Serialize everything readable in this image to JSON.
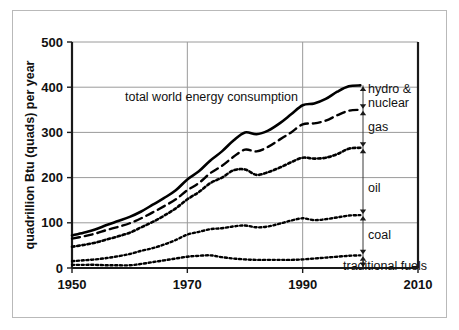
{
  "chart_data": {
    "type": "line",
    "title": "",
    "xlabel": "",
    "ylabel": "quadrillion Btu (quads) per year",
    "xlim": [
      1950,
      2010
    ],
    "ylim": [
      0,
      500
    ],
    "xticks": [
      1950,
      1970,
      1990,
      2010
    ],
    "yticks": [
      0,
      100,
      200,
      300,
      400,
      500
    ],
    "grid": true,
    "legend_position": "right-inline-labels",
    "annotations": [
      {
        "text": "total world energy consumption",
        "x": 1966,
        "y": 368
      }
    ],
    "x": [
      1950,
      1952,
      1954,
      1956,
      1958,
      1960,
      1962,
      1964,
      1966,
      1968,
      1970,
      1972,
      1974,
      1976,
      1978,
      1980,
      1982,
      1984,
      1986,
      1988,
      1990,
      1992,
      1994,
      1996,
      1998,
      2000
    ],
    "series": [
      {
        "name": "total world energy consumption",
        "label": "total world energy consumption",
        "style": "solid",
        "values": [
          72,
          78,
          85,
          95,
          104,
          113,
          125,
          140,
          155,
          172,
          196,
          214,
          238,
          258,
          282,
          300,
          296,
          304,
          320,
          340,
          360,
          364,
          374,
          390,
          402,
          404
        ]
      },
      {
        "name": "hydro-and-nuclear-boundary",
        "label": "hydro & nuclear",
        "style": "dashed",
        "values": [
          65,
          70,
          76,
          84,
          91,
          99,
          110,
          123,
          137,
          152,
          172,
          188,
          210,
          226,
          246,
          262,
          258,
          268,
          284,
          300,
          318,
          320,
          326,
          338,
          348,
          350
        ]
      },
      {
        "name": "gas-boundary",
        "label": "gas",
        "style": "dotted-coarse",
        "values": [
          47,
          51,
          56,
          63,
          70,
          78,
          90,
          102,
          116,
          132,
          152,
          168,
          188,
          200,
          216,
          218,
          206,
          212,
          222,
          234,
          244,
          242,
          244,
          252,
          264,
          266
        ]
      },
      {
        "name": "oil-boundary",
        "label": "oil",
        "style": "dotted-fine",
        "values": [
          15,
          17,
          19,
          22,
          26,
          31,
          38,
          44,
          52,
          62,
          74,
          80,
          86,
          88,
          92,
          94,
          90,
          92,
          98,
          105,
          110,
          106,
          108,
          112,
          116,
          117
        ]
      },
      {
        "name": "coal-boundary",
        "label": "coal",
        "style": "dotted-fine",
        "values": [
          7,
          7,
          7,
          6,
          6,
          6,
          9,
          13,
          17,
          21,
          25,
          27,
          28,
          24,
          21,
          19,
          18,
          18,
          18,
          18,
          19,
          21,
          23,
          25,
          27,
          28
        ]
      }
    ],
    "stack_labels": [
      "hydro & nuclear",
      "gas",
      "oil",
      "coal",
      "traditional fuels"
    ],
    "brackets": [
      {
        "label": "hydro & nuclear",
        "top": 404,
        "bottom": 350
      },
      {
        "label": "gas",
        "top": 350,
        "bottom": 266
      },
      {
        "label": "oil",
        "top": 266,
        "bottom": 117
      },
      {
        "label": "coal",
        "top": 117,
        "bottom": 28
      },
      {
        "label": "traditional fuels",
        "top": 28,
        "bottom": 0
      }
    ]
  },
  "axis": {
    "y_title": "quadrillion Btu (quads) per year",
    "y_ticks": [
      "0",
      "100",
      "200",
      "300",
      "400",
      "500"
    ],
    "x_ticks": [
      "1950",
      "1970",
      "1990",
      "2010"
    ]
  },
  "labels": {
    "main_annotation": "total world energy consumption",
    "hydro_nuclear_line1": "hydro &",
    "hydro_nuclear_line2": "nuclear",
    "gas": "gas",
    "oil": "oil",
    "coal": "coal",
    "traditional_fuels": "traditional fuels"
  },
  "colors": {
    "ink": "#000000",
    "grid": "#9a9a9a",
    "frame": "#b9b9b9",
    "background": "#ffffff"
  }
}
